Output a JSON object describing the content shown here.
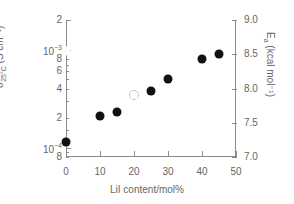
{
  "chart_data": {
    "type": "scatter",
    "title": "",
    "xlabel": "LiI content/mol%",
    "xlim": [
      0,
      50
    ],
    "xticks": [
      0,
      10,
      20,
      30,
      40,
      50
    ],
    "xticklabels": [
      "0",
      "10",
      "20",
      "30",
      "40",
      "50"
    ],
    "grid": false,
    "legend": "none",
    "left_axis": {
      "label_sigma": "σ",
      "label_subscript": "25°C",
      "label_units": "(S cm⁻¹)",
      "scale": "log",
      "ylim": [
        8e-05,
        0.002
      ],
      "ticklabels": [
        "2",
        "10⁻³",
        "8",
        "6",
        "4",
        "2",
        "10⁻⁴",
        "8"
      ],
      "tickvalues": [
        0.002,
        0.001,
        0.0008,
        0.0006,
        0.0004,
        0.0002,
        0.0001,
        8e-05
      ]
    },
    "right_axis": {
      "label_E": "E",
      "label_subscript": "a",
      "label_units": "(kcal mol⁻¹)",
      "scale": "linear",
      "ylim": [
        7.0,
        9.0
      ],
      "ticklabels": [
        "9.0",
        "8.5",
        "8.0",
        "7.5",
        "7.0"
      ],
      "tickvalues": [
        9.0,
        8.5,
        8.0,
        7.5,
        7.0
      ]
    },
    "series": [
      {
        "name": "conductivity",
        "marker": "filled-circle",
        "axis": "left",
        "color": "#111111",
        "points": [
          {
            "x": 0,
            "y": 0.000115
          },
          {
            "x": 10,
            "y": 0.00021
          },
          {
            "x": 15,
            "y": 0.000232
          },
          {
            "x": 20,
            "y": 0.00034
          },
          {
            "x": 25,
            "y": 0.00038
          },
          {
            "x": 30,
            "y": 0.0005
          },
          {
            "x": 40,
            "y": 0.0008
          },
          {
            "x": 45,
            "y": 0.0009
          }
        ]
      },
      {
        "name": "activation-energy",
        "marker": "open-circle",
        "axis": "right",
        "color": "#4d4d4d",
        "points": [
          {
            "x": 0,
            "y": 8.55
          },
          {
            "x": 10,
            "y": 8.1
          },
          {
            "x": 15,
            "y": 7.95
          },
          {
            "x": 20,
            "y": 7.9
          },
          {
            "x": 25,
            "y": 7.76
          },
          {
            "x": 30,
            "y": 7.6
          },
          {
            "x": 40,
            "y": 7.2
          },
          {
            "x": 45,
            "y": 7.2
          }
        ]
      }
    ]
  }
}
